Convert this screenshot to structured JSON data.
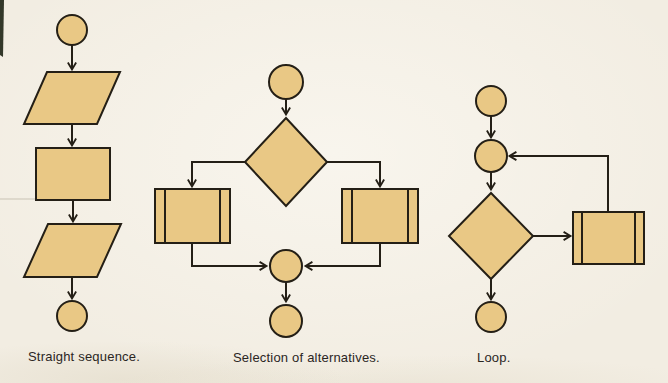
{
  "colors": {
    "page_background": "#f2ede2",
    "shape_fill": "#e9c885",
    "shape_stroke": "#241f16",
    "caption_text": "#2b261f",
    "scan_edge": "#232819",
    "scan_line": "#c9c3b4"
  },
  "figures": [
    {
      "id": "straight-sequence",
      "caption": "Straight sequence.",
      "nodes": [
        "terminal-circle-start",
        "input-output-parallelogram",
        "process-rectangle",
        "input-output-parallelogram",
        "terminal-circle-end"
      ],
      "flow": "top-to-bottom single path with downward arrows"
    },
    {
      "id": "selection-of-alternatives",
      "caption": "Selection of alternatives.",
      "nodes": [
        "terminal-circle-start",
        "decision-diamond",
        "predefined-process-box-left",
        "predefined-process-box-right",
        "merge-connector-circle",
        "terminal-circle-end"
      ],
      "flow": "diamond branches left and right into two double-barred boxes that merge into a connector circle, then end"
    },
    {
      "id": "loop",
      "caption": "Loop.",
      "nodes": [
        "terminal-circle-start",
        "loop-connector-circle",
        "decision-diamond",
        "predefined-process-box",
        "terminal-circle-end"
      ],
      "flow": "diamond exits right into a double-barred box whose output loops back up into the connector circle; diamond bottom exits to end"
    }
  ]
}
